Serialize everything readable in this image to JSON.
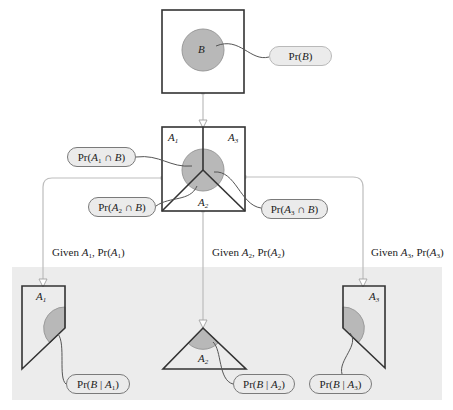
{
  "colors": {
    "panel": "#ececec",
    "circle_fill": "#b8b8b8",
    "circle_stroke": "#9a9a9a",
    "box_stroke": "#333333",
    "connector": "#bdbdbd",
    "leader": "#555555"
  },
  "top": {
    "circle_label": "B",
    "pill": {
      "fn": "Pr(",
      "var": "B",
      "close": ")"
    }
  },
  "middle": {
    "regions": [
      {
        "letter": "A",
        "sub": "1"
      },
      {
        "letter": "A",
        "sub": "3"
      },
      {
        "letter": "A",
        "sub": "2"
      }
    ],
    "pills": [
      {
        "fn": "Pr(",
        "var": "A",
        "sub": "1",
        "op": " ∩ ",
        "var2": "B",
        "close": ")"
      },
      {
        "fn": "Pr(",
        "var": "A",
        "sub": "2",
        "op": " ∩ ",
        "var2": "B",
        "close": ")"
      },
      {
        "fn": "Pr(",
        "var": "A",
        "sub": "3",
        "op": " ∩ ",
        "var2": "B",
        "close": ")"
      }
    ]
  },
  "branches": [
    {
      "given": "Given ",
      "var": "A",
      "sub": "1",
      "sep": ", Pr(",
      "var2": "A",
      "sub2": "1",
      "close": ")"
    },
    {
      "given": "Given ",
      "var": "A",
      "sub": "2",
      "sep": ", Pr(",
      "var2": "A",
      "sub2": "2",
      "close": ")"
    },
    {
      "given": "Given ",
      "var": "A",
      "sub": "3",
      "sep": ", Pr(",
      "var2": "A",
      "sub2": "3",
      "close": ")"
    }
  ],
  "bottom": {
    "regions": [
      {
        "letter": "A",
        "sub": "1"
      },
      {
        "letter": "A",
        "sub": "2"
      },
      {
        "letter": "A",
        "sub": "3"
      }
    ],
    "pills": [
      {
        "fn": "Pr(",
        "var": "B",
        "bar": " | ",
        "var2": "A",
        "sub": "1",
        "close": ")"
      },
      {
        "fn": "Pr(",
        "var": "B",
        "bar": " | ",
        "var2": "A",
        "sub": "2",
        "close": ")"
      },
      {
        "fn": "Pr(",
        "var": "B",
        "bar": " | ",
        "var2": "A",
        "sub": "3",
        "close": ")"
      }
    ]
  }
}
